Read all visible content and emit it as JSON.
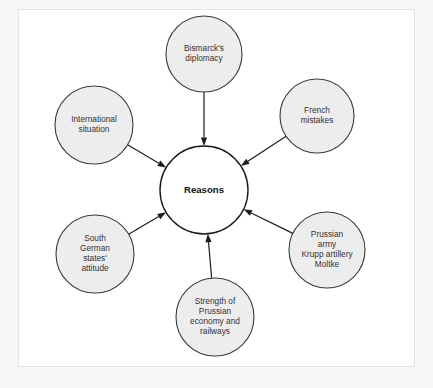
{
  "diagram": {
    "title": "Reasons",
    "type": "spider-diagram",
    "center": {
      "id": "reasons",
      "label": "Reasons",
      "lines": [
        "Reasons"
      ],
      "cx": 204,
      "cy": 190,
      "r": 44,
      "fill": "#ffffff",
      "stroke": "#1c1c1c"
    },
    "node_fill": "#ededed",
    "node_stroke": "#3a3a3a",
    "text_color": "#333333",
    "arrow_color": "#1c1c1c",
    "panel_bg": "#ffffff",
    "frame_bg": "#f7f7f7",
    "nodes": [
      {
        "id": "bismarck-diplomacy",
        "lines": [
          "Bismarck's",
          "diplomacy"
        ],
        "cx": 204,
        "cy": 54,
        "r": 38,
        "angle_deg": 270
      },
      {
        "id": "french-mistakes",
        "lines": [
          "French",
          "mistakes"
        ],
        "cx": 317,
        "cy": 116,
        "r": 37,
        "angle_deg": 331
      },
      {
        "id": "prussian-army",
        "lines": [
          "Prussian",
          "army",
          "Krupp artillery",
          "Moltke"
        ],
        "cx": 327,
        "cy": 250,
        "r": 38,
        "angle_deg": 29
      },
      {
        "id": "strength-prussian-economy",
        "lines": [
          "Strength of",
          "Prussian",
          "economy and",
          "railways"
        ],
        "cx": 215,
        "cy": 317,
        "r": 39,
        "angle_deg": 87
      },
      {
        "id": "south-german-states",
        "lines": [
          "South",
          "German",
          "states'",
          "attitude"
        ],
        "cx": 95,
        "cy": 254,
        "r": 39,
        "angle_deg": 152
      },
      {
        "id": "international-situation",
        "lines": [
          "International",
          "situation"
        ],
        "cx": 94,
        "cy": 125,
        "r": 39,
        "angle_deg": 208
      }
    ]
  }
}
